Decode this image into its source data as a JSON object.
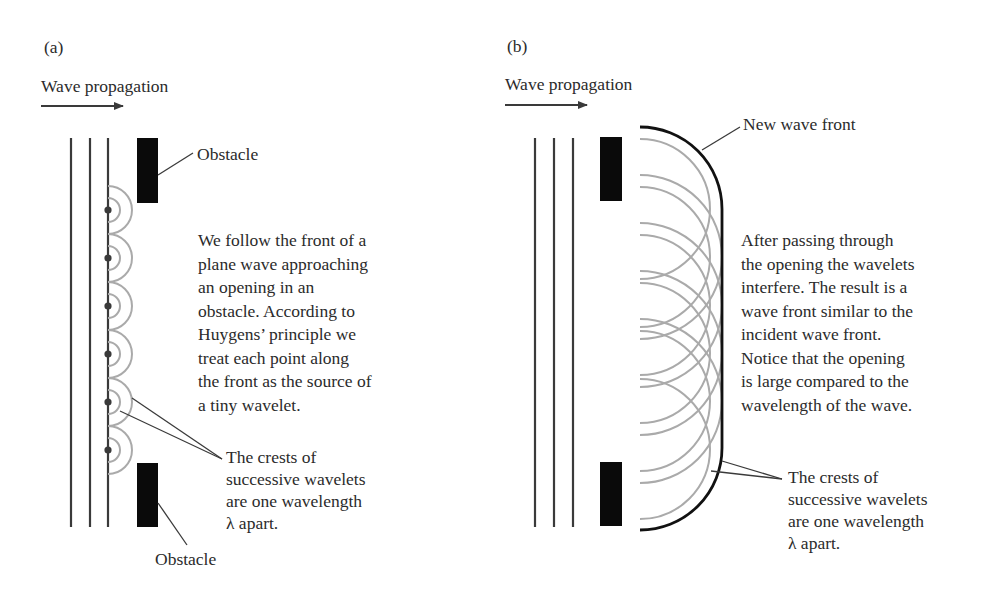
{
  "panel_a": {
    "label": "(a)",
    "propagation_label": "Wave propagation",
    "obstacle_top_label": "Obstacle",
    "obstacle_bottom_label": "Obstacle",
    "description_lines": [
      "We follow the front of a",
      "plane wave approaching",
      "an opening in an",
      "obstacle. According to",
      "Huygens’ principle we",
      "treat each point along",
      "the front as the source of",
      "a tiny wavelet."
    ],
    "crest_lines": [
      "The crests of",
      "successive wavelets",
      "are one wavelength",
      "λ apart."
    ]
  },
  "panel_b": {
    "label": "(b)",
    "propagation_label": "Wave propagation",
    "new_front_label": "New wave front",
    "description_lines": [
      "After passing through",
      "the opening the wavelets",
      "interfere. The result is a",
      "wave front similar to the",
      "incident wave front.",
      "Notice that the opening",
      "is large compared to the",
      "wavelength of the wave."
    ],
    "crest_lines": [
      "The crests of",
      "successive wavelets",
      "are one wavelength",
      "λ apart."
    ]
  },
  "colors": {
    "wave_line": "#3a3a3a",
    "wavelet": "#aaaaaa",
    "obstacle": "#0a0a0a",
    "front": "#111111"
  }
}
